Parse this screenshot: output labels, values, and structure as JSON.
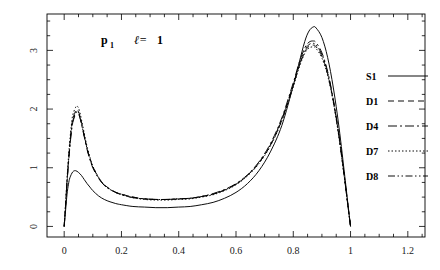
{
  "chart_data": {
    "type": "line",
    "title": "",
    "annotation": {
      "symbol": "p",
      "subscript": "1",
      "ell": "ℓ=",
      "ell_value": "1"
    },
    "xlabel": "",
    "ylabel": "",
    "xlim": [
      -0.06,
      1.26
    ],
    "ylim": [
      -0.18,
      3.62
    ],
    "xticks": [
      0,
      0.2,
      0.4,
      0.6,
      0.8,
      1,
      1.2
    ],
    "xtick_labels": [
      "0",
      "0.2",
      "0.4",
      "0.6",
      "0.8",
      "1",
      "1.2"
    ],
    "yticks": [
      0,
      1,
      2,
      3
    ],
    "ytick_labels": [
      "0",
      "1",
      "2",
      "3"
    ],
    "x_minor_step": 0.05,
    "y_minor_step": 0.25,
    "grid": false,
    "legend_position": "right-outside",
    "series": [
      {
        "name": "S1",
        "dash": "none",
        "color": "#000000",
        "x": [
          0.0,
          0.005,
          0.01,
          0.015,
          0.02,
          0.03,
          0.04,
          0.05,
          0.06,
          0.07,
          0.08,
          0.09,
          0.1,
          0.12,
          0.14,
          0.16,
          0.18,
          0.2,
          0.24,
          0.28,
          0.32,
          0.36,
          0.4,
          0.44,
          0.48,
          0.52,
          0.56,
          0.6,
          0.64,
          0.68,
          0.72,
          0.76,
          0.8,
          0.82,
          0.84,
          0.855,
          0.87,
          0.88,
          0.9,
          0.92,
          0.94,
          0.96,
          0.98,
          0.99,
          1.0
        ],
        "y": [
          0.0,
          0.28,
          0.55,
          0.72,
          0.83,
          0.93,
          0.95,
          0.92,
          0.87,
          0.8,
          0.73,
          0.67,
          0.61,
          0.52,
          0.46,
          0.42,
          0.39,
          0.37,
          0.34,
          0.33,
          0.32,
          0.32,
          0.33,
          0.34,
          0.37,
          0.41,
          0.48,
          0.58,
          0.73,
          0.95,
          1.27,
          1.72,
          2.4,
          2.78,
          3.15,
          3.33,
          3.4,
          3.38,
          3.22,
          2.88,
          2.36,
          1.68,
          0.85,
          0.42,
          0.0
        ]
      },
      {
        "name": "D1",
        "dash": "6,4",
        "color": "#000000",
        "x": [
          0.0,
          0.005,
          0.01,
          0.015,
          0.02,
          0.025,
          0.03,
          0.04,
          0.045,
          0.05,
          0.055,
          0.06,
          0.07,
          0.08,
          0.09,
          0.1,
          0.12,
          0.14,
          0.16,
          0.18,
          0.2,
          0.24,
          0.28,
          0.32,
          0.36,
          0.4,
          0.44,
          0.48,
          0.52,
          0.56,
          0.6,
          0.64,
          0.68,
          0.72,
          0.76,
          0.8,
          0.82,
          0.84,
          0.855,
          0.87,
          0.88,
          0.9,
          0.92,
          0.94,
          0.96,
          0.98,
          0.99,
          1.0
        ],
        "y": [
          0.0,
          0.38,
          0.78,
          1.12,
          1.42,
          1.66,
          1.83,
          1.97,
          1.99,
          1.96,
          1.88,
          1.78,
          1.55,
          1.33,
          1.16,
          1.02,
          0.83,
          0.71,
          0.64,
          0.58,
          0.55,
          0.5,
          0.47,
          0.46,
          0.46,
          0.47,
          0.48,
          0.51,
          0.55,
          0.62,
          0.72,
          0.87,
          1.08,
          1.38,
          1.81,
          2.4,
          2.72,
          2.97,
          3.07,
          3.09,
          3.06,
          2.9,
          2.6,
          2.13,
          1.52,
          0.78,
          0.39,
          0.0
        ]
      },
      {
        "name": "D4",
        "dash": "9,3,2,3",
        "color": "#000000",
        "x": [
          0.0,
          0.005,
          0.01,
          0.015,
          0.02,
          0.025,
          0.03,
          0.04,
          0.045,
          0.05,
          0.055,
          0.06,
          0.07,
          0.08,
          0.09,
          0.1,
          0.12,
          0.14,
          0.16,
          0.18,
          0.2,
          0.24,
          0.28,
          0.32,
          0.36,
          0.4,
          0.44,
          0.48,
          0.52,
          0.56,
          0.6,
          0.64,
          0.68,
          0.72,
          0.76,
          0.8,
          0.82,
          0.84,
          0.855,
          0.87,
          0.88,
          0.9,
          0.92,
          0.94,
          0.96,
          0.98,
          0.99,
          1.0
        ],
        "y": [
          0.0,
          0.36,
          0.74,
          1.07,
          1.36,
          1.6,
          1.77,
          1.92,
          1.95,
          1.92,
          1.85,
          1.75,
          1.53,
          1.31,
          1.14,
          1.0,
          0.82,
          0.7,
          0.63,
          0.58,
          0.54,
          0.49,
          0.47,
          0.46,
          0.46,
          0.47,
          0.48,
          0.51,
          0.56,
          0.63,
          0.73,
          0.88,
          1.1,
          1.41,
          1.85,
          2.45,
          2.78,
          3.04,
          3.14,
          3.16,
          3.13,
          2.96,
          2.64,
          2.16,
          1.54,
          0.79,
          0.39,
          0.0
        ]
      },
      {
        "name": "D7",
        "dash": "1.5,2",
        "color": "#000000",
        "x": [
          0.0,
          0.005,
          0.01,
          0.015,
          0.02,
          0.025,
          0.03,
          0.04,
          0.045,
          0.05,
          0.055,
          0.06,
          0.07,
          0.08,
          0.09,
          0.1,
          0.12,
          0.14,
          0.16,
          0.18,
          0.2,
          0.24,
          0.28,
          0.32,
          0.36,
          0.4,
          0.44,
          0.48,
          0.52,
          0.56,
          0.6,
          0.64,
          0.68,
          0.72,
          0.76,
          0.8,
          0.82,
          0.84,
          0.855,
          0.87,
          0.88,
          0.9,
          0.92,
          0.94,
          0.96,
          0.98,
          0.99,
          1.0
        ],
        "y": [
          0.0,
          0.4,
          0.82,
          1.18,
          1.48,
          1.72,
          1.9,
          2.03,
          2.05,
          2.02,
          1.94,
          1.83,
          1.59,
          1.36,
          1.18,
          1.03,
          0.84,
          0.71,
          0.63,
          0.58,
          0.54,
          0.49,
          0.46,
          0.45,
          0.45,
          0.46,
          0.47,
          0.5,
          0.54,
          0.61,
          0.71,
          0.86,
          1.07,
          1.37,
          1.8,
          2.38,
          2.7,
          2.95,
          3.04,
          3.06,
          3.03,
          2.87,
          2.57,
          2.11,
          1.5,
          0.77,
          0.38,
          0.0
        ]
      },
      {
        "name": "D8",
        "dash": "7,2.5,1.5,2.5,1.5,2.5",
        "color": "#000000",
        "x": [
          0.0,
          0.005,
          0.01,
          0.015,
          0.02,
          0.025,
          0.03,
          0.04,
          0.045,
          0.05,
          0.055,
          0.06,
          0.07,
          0.08,
          0.09,
          0.1,
          0.12,
          0.14,
          0.16,
          0.18,
          0.2,
          0.24,
          0.28,
          0.32,
          0.36,
          0.4,
          0.44,
          0.48,
          0.52,
          0.56,
          0.6,
          0.64,
          0.68,
          0.72,
          0.76,
          0.8,
          0.82,
          0.84,
          0.855,
          0.87,
          0.88,
          0.9,
          0.92,
          0.94,
          0.96,
          0.98,
          0.99,
          1.0
        ],
        "y": [
          0.0,
          0.37,
          0.76,
          1.1,
          1.39,
          1.63,
          1.8,
          1.94,
          1.97,
          1.94,
          1.86,
          1.76,
          1.54,
          1.32,
          1.15,
          1.01,
          0.83,
          0.7,
          0.63,
          0.58,
          0.55,
          0.5,
          0.47,
          0.46,
          0.46,
          0.47,
          0.48,
          0.51,
          0.55,
          0.62,
          0.72,
          0.87,
          1.09,
          1.39,
          1.83,
          2.42,
          2.74,
          3.0,
          3.1,
          3.12,
          3.09,
          2.93,
          2.62,
          2.14,
          1.53,
          0.78,
          0.39,
          0.0
        ]
      }
    ]
  },
  "legend": {
    "items": [
      {
        "label": "S1"
      },
      {
        "label": "D1"
      },
      {
        "label": "D4"
      },
      {
        "label": "D7"
      },
      {
        "label": "D8"
      }
    ]
  }
}
